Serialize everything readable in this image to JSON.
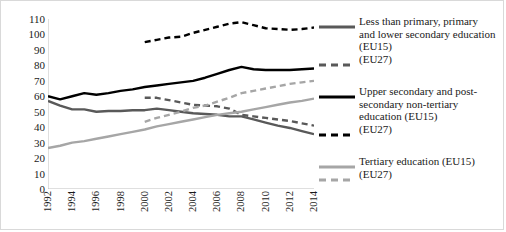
{
  "chart_data": {
    "type": "line",
    "title": "",
    "xlabel": "",
    "ylabel": "",
    "x": [
      1992,
      1993,
      1994,
      1995,
      1996,
      1997,
      1998,
      1999,
      2000,
      2001,
      2002,
      2003,
      2004,
      2005,
      2006,
      2007,
      2008,
      2009,
      2010,
      2011,
      2012,
      2013,
      2014
    ],
    "xlim": [
      1992,
      2014
    ],
    "ylim": [
      0,
      110
    ],
    "ytick_labels": [
      "0",
      "10",
      "20",
      "30",
      "40",
      "50",
      "60",
      "70",
      "80",
      "90",
      "100",
      "110"
    ],
    "ytick_values": [
      0,
      10,
      20,
      30,
      40,
      50,
      60,
      70,
      80,
      90,
      100,
      110
    ],
    "xtick_labels": [
      "1992",
      "1994",
      "1996",
      "1998",
      "2000",
      "2002",
      "2004",
      "2006",
      "2008",
      "2010",
      "2012",
      "2014"
    ],
    "xtick_values": [
      1992,
      1994,
      1996,
      1998,
      2000,
      2002,
      2004,
      2006,
      2008,
      2010,
      2012,
      2014
    ],
    "grid": false,
    "legend_position": "right",
    "series": [
      {
        "name": "Less than primary, primary and lower secondary education (EU15)",
        "style": "solid",
        "color": "#595959",
        "x": [
          1992,
          1993,
          1994,
          1995,
          1996,
          1997,
          1998,
          1999,
          2000,
          2001,
          2002,
          2003,
          2004,
          2005,
          2006,
          2007,
          2008,
          2009,
          2010,
          2011,
          2012,
          2013,
          2014
        ],
        "values": [
          57,
          54,
          51.5,
          51.5,
          50,
          50.5,
          50.5,
          51,
          51,
          52,
          51,
          50,
          49,
          48.5,
          48,
          47,
          47,
          45,
          43,
          41,
          39.5,
          37.5,
          35.5
        ]
      },
      {
        "name": "Less than primary, primary and lower secondary education (EU27)",
        "style": "dashed",
        "color": "#595959",
        "x": [
          2000,
          2001,
          2002,
          2003,
          2004,
          2005,
          2006,
          2007,
          2008,
          2009,
          2010,
          2011,
          2012,
          2013,
          2014
        ],
        "values": [
          59,
          59,
          57.5,
          56,
          54.5,
          54,
          53.5,
          52,
          48,
          47,
          46,
          45,
          44,
          42.5,
          41
        ]
      },
      {
        "name": "Upper secondary and post-secondary non-tertiary education (EU15)",
        "style": "solid",
        "color": "#000000",
        "x": [
          1992,
          1993,
          1994,
          1995,
          1996,
          1997,
          1998,
          1999,
          2000,
          2001,
          2002,
          2003,
          2004,
          2005,
          2006,
          2007,
          2008,
          2009,
          2010,
          2011,
          2012,
          2013,
          2014
        ],
        "values": [
          60,
          58,
          60,
          62,
          61,
          62,
          63.5,
          64.5,
          66,
          67,
          68,
          69,
          70,
          72,
          74.5,
          77,
          79,
          77.5,
          77,
          77,
          77,
          77.5,
          78
        ]
      },
      {
        "name": "Upper secondary and post-secondary non-tertiary education (EU27)",
        "style": "dashed",
        "color": "#000000",
        "x": [
          2000,
          2001,
          2002,
          2003,
          2004,
          2005,
          2006,
          2007,
          2008,
          2009,
          2010,
          2011,
          2012,
          2013,
          2014
        ],
        "values": [
          95,
          96.5,
          98,
          98.5,
          101,
          103,
          105,
          107,
          108,
          106,
          104,
          103.5,
          103,
          103.5,
          104.5
        ]
      },
      {
        "name": "Tertiary education (EU15)",
        "style": "solid",
        "color": "#a6a6a6",
        "x": [
          1992,
          1993,
          1994,
          1995,
          1996,
          1997,
          1998,
          1999,
          2000,
          2001,
          2002,
          2003,
          2004,
          2005,
          2006,
          2007,
          2008,
          2009,
          2010,
          2011,
          2012,
          2013,
          2014
        ],
        "values": [
          26.5,
          28,
          30,
          31,
          32.5,
          34,
          35.5,
          37,
          38.5,
          40.5,
          42,
          43.5,
          45,
          46.5,
          48,
          49,
          50,
          51.5,
          53,
          54.5,
          56,
          57,
          58.5
        ]
      },
      {
        "name": "Tertiary education (EU27)",
        "style": "dashed",
        "color": "#a6a6a6",
        "x": [
          2000,
          2001,
          2002,
          2003,
          2004,
          2005,
          2006,
          2007,
          2008,
          2009,
          2010,
          2011,
          2012,
          2013,
          2014
        ],
        "values": [
          43.5,
          46,
          48,
          50,
          52.5,
          54,
          56.5,
          59,
          62,
          63.5,
          65,
          66.5,
          68,
          69,
          70
        ]
      }
    ]
  },
  "legend": {
    "groups": [
      {
        "solid_label": "Less than primary, primary\nand lower secondary education\n(EU15)",
        "dashed_label": "(EU27)",
        "color": "#595959"
      },
      {
        "solid_label": "Upper secondary and post-\nsecondary non-tertiary\neducation (EU15)",
        "dashed_label": "(EU27)",
        "color": "#000000"
      },
      {
        "solid_label": "Tertiary education (EU15)",
        "dashed_label": "(EU27)",
        "color": "#a6a6a6"
      }
    ]
  },
  "colors": {
    "less_than_primary": "#595959",
    "upper_secondary": "#000000",
    "tertiary": "#a6a6a6",
    "axis": "#bfbfbf",
    "text": "#1a1a1a"
  }
}
